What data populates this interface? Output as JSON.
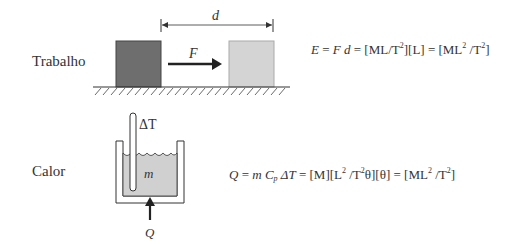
{
  "rows": {
    "work": {
      "label": "Trabalho",
      "distance_symbol": "d",
      "force_symbol": "F",
      "equation": {
        "lhs": "E",
        "eq1": " = ",
        "f": "F",
        "d": " d",
        "eq2": " = [ML/T",
        "exp1": "2",
        "mid": "][L] = [ML",
        "exp2": "2",
        "mid2": " /T",
        "exp3": "2",
        "end": "]"
      }
    },
    "heat": {
      "label": "Calor",
      "temp_symbol": "ΔT",
      "mass_symbol": "m",
      "heat_symbol": "Q",
      "equation": {
        "lhs": "Q",
        "eq1": " = ",
        "m": "m",
        "c": " C",
        "sub_p": "p",
        "dt": " ΔT",
        "eq2": " = [M][L",
        "exp1": "2",
        "mid": " /T",
        "exp2": "2",
        "theta1": "θ][θ] = [ML",
        "exp3": "2",
        "mid2": " /T",
        "exp4": "2",
        "end": "]"
      }
    }
  },
  "colors": {
    "block_dark": "#6e6e6e",
    "block_light": "#d4d4d4",
    "liquid": "#d0d0d0",
    "line": "#333333"
  }
}
